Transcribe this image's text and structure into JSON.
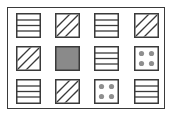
{
  "diagram": {
    "type": "pattern-grid",
    "rows": 3,
    "columns": 4,
    "colors": {
      "frame": "#3a3a3a",
      "tile_border": "#3a3a3a",
      "line": "#3a3a3a",
      "fill_gray": "#8a8a8a",
      "dot_gray": "#8f8f8f",
      "background": "#ffffff"
    },
    "tiles": [
      {
        "row": 1,
        "col": 1,
        "pattern": "horizontal-stripes"
      },
      {
        "row": 1,
        "col": 2,
        "pattern": "diagonal-stripes"
      },
      {
        "row": 1,
        "col": 3,
        "pattern": "horizontal-stripes"
      },
      {
        "row": 1,
        "col": 4,
        "pattern": "diagonal-stripes"
      },
      {
        "row": 2,
        "col": 1,
        "pattern": "diagonal-stripes"
      },
      {
        "row": 2,
        "col": 2,
        "pattern": "solid-gray"
      },
      {
        "row": 2,
        "col": 3,
        "pattern": "horizontal-stripes"
      },
      {
        "row": 2,
        "col": 4,
        "pattern": "four-dots"
      },
      {
        "row": 3,
        "col": 1,
        "pattern": "horizontal-stripes"
      },
      {
        "row": 3,
        "col": 2,
        "pattern": "diagonal-stripes"
      },
      {
        "row": 3,
        "col": 3,
        "pattern": "four-dots"
      },
      {
        "row": 3,
        "col": 4,
        "pattern": "horizontal-stripes"
      }
    ]
  }
}
